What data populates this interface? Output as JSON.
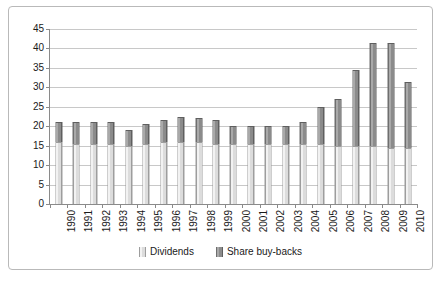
{
  "chart_data": {
    "type": "bar",
    "subtype": "stacked-column",
    "title": "",
    "xlabel": "",
    "ylabel": "",
    "ylim": [
      0,
      45
    ],
    "ytick_step": 5,
    "yticks": [
      0,
      5,
      10,
      15,
      20,
      25,
      30,
      35,
      40,
      45
    ],
    "grid": true,
    "legend_position": "bottom",
    "categories": [
      "1990",
      "1991",
      "1992",
      "1993",
      "1994",
      "1995",
      "1996",
      "1997",
      "1998",
      "1999",
      "2000",
      "2001",
      "2002",
      "2003",
      "2004",
      "2005",
      "2006",
      "2007",
      "2008",
      "2009",
      "2010"
    ],
    "series": [
      {
        "name": "Dividends",
        "color": "#dcdcdc",
        "values": [
          16,
          15.5,
          15.5,
          15.5,
          15,
          15.5,
          16,
          16,
          16,
          15.5,
          15.5,
          15.5,
          15.5,
          15.5,
          15.5,
          15.5,
          15,
          15,
          15,
          14.5,
          14.5
        ]
      },
      {
        "name": "Share buy-backs",
        "color": "#8b8b8b",
        "values": [
          5,
          5.5,
          5.5,
          5.5,
          4,
          5,
          5.5,
          6.5,
          6,
          6,
          4.5,
          4.5,
          4.5,
          4.5,
          5.5,
          9.5,
          12,
          19.5,
          26.5,
          27,
          17
        ]
      }
    ],
    "totals": [
      21,
      21,
      21,
      21,
      19,
      20.5,
      21.5,
      22.5,
      22,
      21.5,
      20,
      20,
      20,
      20,
      21,
      25,
      27,
      34.5,
      41.5,
      41.5,
      31.5
    ]
  },
  "legend": {
    "items": [
      {
        "label": "Dividends",
        "swatch": "dividends-swatch"
      },
      {
        "label": "Share buy-backs",
        "swatch": "share-buybacks-swatch"
      }
    ]
  }
}
